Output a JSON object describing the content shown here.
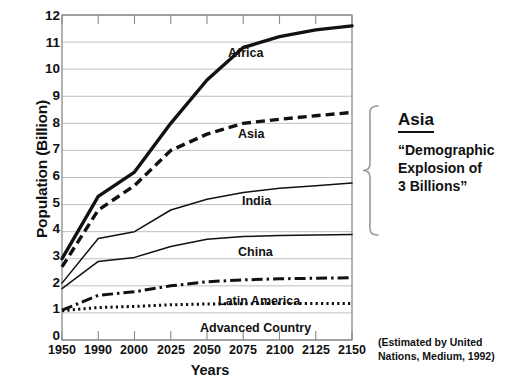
{
  "chart_data": {
    "type": "line",
    "title": "",
    "xlabel": "Years",
    "ylabel": "Population (Billion)",
    "categories": [
      "1950",
      "1990",
      "2000",
      "2025",
      "2050",
      "2075",
      "2100",
      "2125",
      "2150"
    ],
    "ylim": [
      0,
      12
    ],
    "yticks": [
      "0",
      "1",
      "2",
      "3",
      "4",
      "5",
      "6",
      "7",
      "8",
      "9",
      "10",
      "11",
      "12"
    ],
    "grid": true,
    "legend_position": "inline-labels",
    "series": [
      {
        "name": "Africa",
        "style": "solid-thick",
        "values": [
          3.0,
          5.3,
          6.2,
          8.0,
          9.6,
          10.8,
          11.2,
          11.45,
          11.6
        ]
      },
      {
        "name": "Asia",
        "style": "dashed-thick",
        "values": [
          2.7,
          4.8,
          5.7,
          7.0,
          7.6,
          8.0,
          8.15,
          8.28,
          8.4
        ]
      },
      {
        "name": "India",
        "style": "solid-thin",
        "values": [
          2.1,
          3.75,
          4.0,
          4.8,
          5.2,
          5.45,
          5.6,
          5.7,
          5.8
        ]
      },
      {
        "name": "China",
        "style": "solid-thin",
        "values": [
          1.9,
          2.9,
          3.05,
          3.45,
          3.72,
          3.82,
          3.86,
          3.88,
          3.9
        ]
      },
      {
        "name": "Latin America",
        "style": "dashdot",
        "values": [
          1.1,
          1.65,
          1.78,
          2.0,
          2.15,
          2.22,
          2.26,
          2.28,
          2.3
        ]
      },
      {
        "name": "Advanced Country",
        "style": "dotted",
        "values": [
          1.08,
          1.2,
          1.24,
          1.3,
          1.33,
          1.34,
          1.35,
          1.35,
          1.35
        ]
      }
    ],
    "annotations": {
      "callout_title": "Asia",
      "callout_body": "“Demographic Explosion of 3 Billions”",
      "callout_body_lines": [
        "“Demographic",
        "Explosion of",
        "3 Billions”"
      ],
      "footnote": "(Estimated by United Nations, Medium, 1992)",
      "footnote_lines": [
        "(Estimated by United",
        "Nations, Medium, 1992)"
      ]
    },
    "series_label_text": {
      "africa": "Africa",
      "asia": "Asia",
      "india": "India",
      "china": "China",
      "latin_america": "Latin America",
      "advanced_country": "Advanced Country"
    },
    "colors": {
      "line": "#111111",
      "grid": "#b8b8b8",
      "axis": "#555555",
      "background": "#ffffff"
    }
  }
}
